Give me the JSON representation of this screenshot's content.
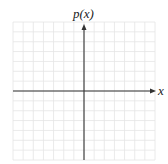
{
  "diagram": {
    "type": "coordinate-grid",
    "y_axis_label": "p(x)",
    "x_axis_label": "x",
    "grid": {
      "columns": 14,
      "rows": 14,
      "line_color": "#e4e4e4"
    },
    "axis_color": "#333333"
  }
}
